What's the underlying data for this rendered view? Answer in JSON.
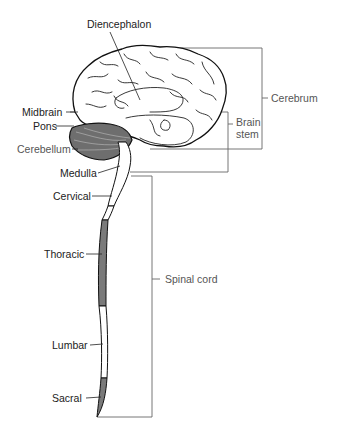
{
  "figure": {
    "labels": {
      "diencephalon": "Diencephalon",
      "midbrain": "Midbrain",
      "pons": "Pons",
      "cerebellum": "Cerebellum",
      "medulla": "Medulla",
      "cervical": "Cervical",
      "thoracic": "Thoracic",
      "lumbar": "Lumbar",
      "sacral": "Sacral"
    },
    "brackets": {
      "cerebrum": "Cerebrum",
      "brain_stem_line1": "Brain",
      "brain_stem_line2": "stem",
      "spinal_cord": "Spinal cord"
    },
    "colors": {
      "line": "#111111",
      "bracket": "#666666",
      "shaded_segment": "#7a7a7a",
      "cerebellum_fill": "#6e6e6e",
      "background": "#ffffff"
    },
    "spinal_segments": [
      "Cervical",
      "Thoracic",
      "Lumbar",
      "Sacral"
    ],
    "shaded_segments": [
      "Thoracic",
      "Sacral"
    ]
  }
}
